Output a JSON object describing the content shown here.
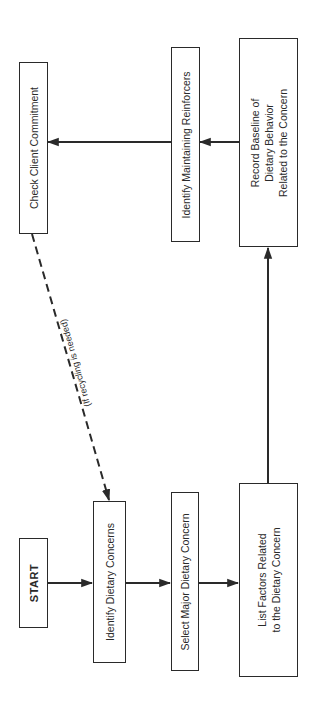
{
  "diagram": {
    "type": "flowchart",
    "orientation": "rotated-90-ccw",
    "nodes": [
      {
        "id": "start",
        "label": "START"
      },
      {
        "id": "identify_concerns",
        "label": "Identify Dietary Concerns"
      },
      {
        "id": "select_major",
        "label": "Select Major Dietary Concern"
      },
      {
        "id": "list_factors",
        "label": "List Factors Related\nto the Dietary Concern"
      },
      {
        "id": "record_baseline",
        "label": "Record Baseline of\nDietary Behavior\nRelated to the Concern"
      },
      {
        "id": "identify_reinforcers",
        "label": "Identify Maintaining Reinforcers"
      },
      {
        "id": "check_commitment",
        "label": "Check Client Commitment"
      }
    ],
    "edges": [
      {
        "from": "start",
        "to": "identify_concerns",
        "style": "solid"
      },
      {
        "from": "identify_concerns",
        "to": "select_major",
        "style": "solid"
      },
      {
        "from": "select_major",
        "to": "list_factors",
        "style": "solid"
      },
      {
        "from": "list_factors",
        "to": "record_baseline",
        "style": "solid"
      },
      {
        "from": "record_baseline",
        "to": "identify_reinforcers",
        "style": "solid"
      },
      {
        "from": "identify_reinforcers",
        "to": "check_commitment",
        "style": "solid"
      },
      {
        "from": "check_commitment",
        "to": "identify_concerns",
        "style": "dashed",
        "label": "(If recycling is needed)"
      }
    ],
    "colors": {
      "line": "#2a2a2a",
      "background": "#ffffff"
    }
  }
}
